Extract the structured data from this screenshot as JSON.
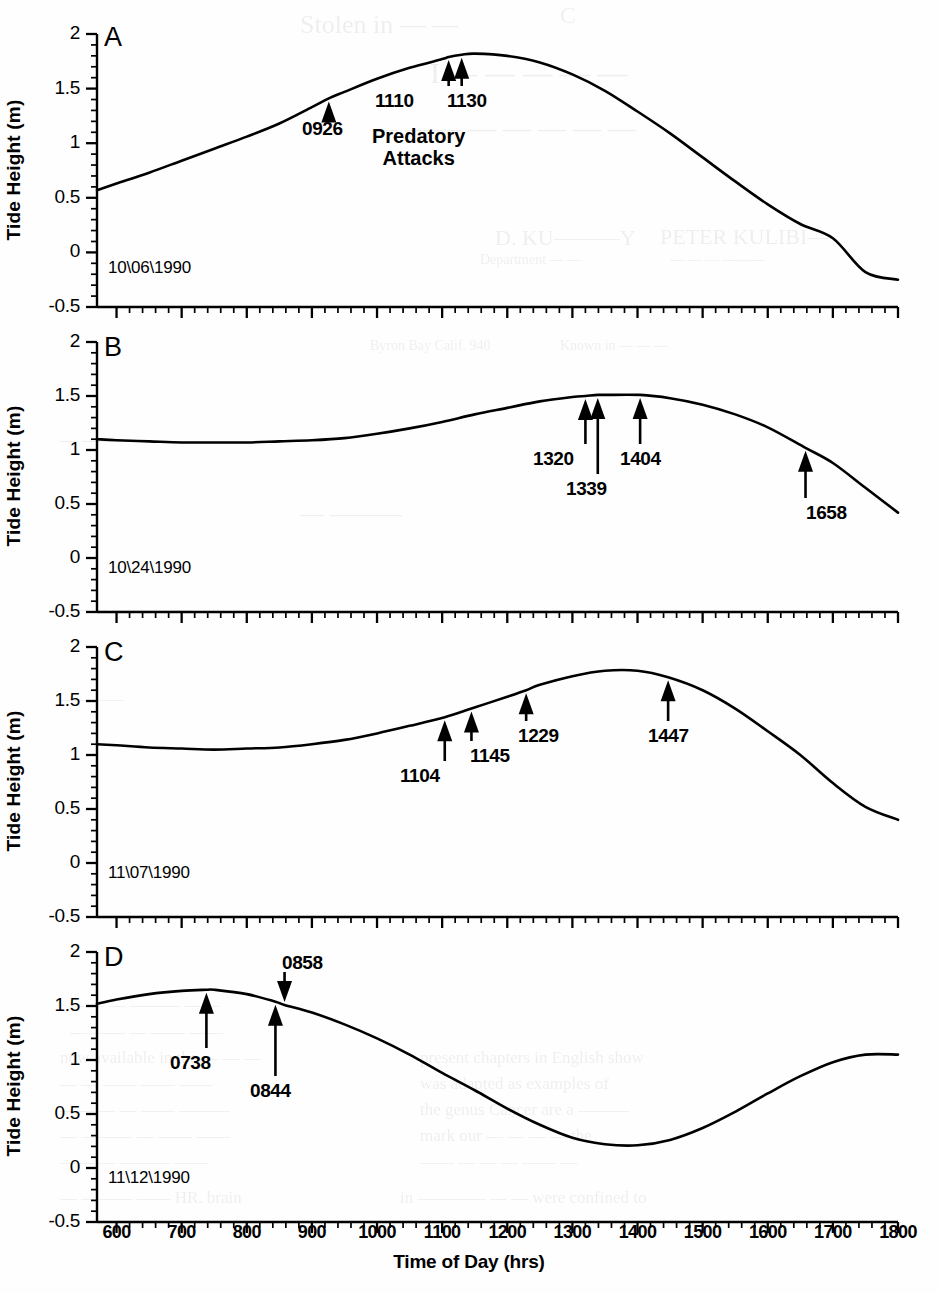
{
  "figure": {
    "y_axis_label": "Tide Height (m)",
    "x_axis_label": "Time of Day (hrs)",
    "attacks_label_line1": "Predatory",
    "attacks_label_line2": "Attacks",
    "y_ticks": [
      "2",
      "1.5",
      "1",
      "0.5",
      "0",
      "-0.5"
    ],
    "x_ticks": [
      "600",
      "700",
      "800",
      "900",
      "1000",
      "1100",
      "1200",
      "1300",
      "1400",
      "1500",
      "1600",
      "1700",
      "1800"
    ],
    "line_color": "#000000",
    "background_color": "#fefefe"
  },
  "chart_data": [
    {
      "type": "line",
      "panel": "A",
      "title": "10\\06\\1990",
      "xlabel": "Time of Day (hrs)",
      "ylabel": "Tide Height (m)",
      "xlim": [
        570,
        1800
      ],
      "ylim": [
        -0.5,
        2
      ],
      "grid": false,
      "x": [
        570,
        600,
        650,
        700,
        750,
        800,
        850,
        900,
        926,
        950,
        1000,
        1050,
        1100,
        1110,
        1130,
        1150,
        1200,
        1250,
        1300,
        1350,
        1400,
        1450,
        1500,
        1550,
        1600,
        1650,
        1700,
        1750,
        1800
      ],
      "values": [
        0.57,
        0.63,
        0.73,
        0.84,
        0.95,
        1.06,
        1.18,
        1.33,
        1.41,
        1.47,
        1.59,
        1.69,
        1.77,
        1.79,
        1.81,
        1.82,
        1.8,
        1.74,
        1.63,
        1.48,
        1.29,
        1.09,
        0.87,
        0.65,
        0.44,
        0.26,
        0.13,
        -0.18,
        -0.25
      ],
      "annotations": [
        {
          "label": "0926",
          "time": 926,
          "tide": 1.41,
          "direction": "up"
        },
        {
          "label": "1110",
          "time": 1110,
          "tide": 1.79,
          "direction": "up"
        },
        {
          "label": "1130",
          "time": 1130,
          "tide": 1.81,
          "direction": "up"
        }
      ]
    },
    {
      "type": "line",
      "panel": "B",
      "title": "10\\24\\1990",
      "xlabel": "Time of Day (hrs)",
      "ylabel": "Tide Height (m)",
      "xlim": [
        570,
        1800
      ],
      "ylim": [
        -0.5,
        2
      ],
      "grid": false,
      "x": [
        570,
        600,
        650,
        700,
        750,
        800,
        850,
        900,
        950,
        1000,
        1050,
        1100,
        1150,
        1200,
        1250,
        1300,
        1320,
        1339,
        1350,
        1404,
        1450,
        1500,
        1550,
        1600,
        1658,
        1700,
        1750,
        1800
      ],
      "values": [
        1.1,
        1.09,
        1.08,
        1.07,
        1.07,
        1.07,
        1.08,
        1.09,
        1.11,
        1.15,
        1.2,
        1.26,
        1.33,
        1.39,
        1.45,
        1.49,
        1.5,
        1.51,
        1.51,
        1.51,
        1.48,
        1.42,
        1.33,
        1.21,
        1.02,
        0.88,
        0.65,
        0.42
      ],
      "annotations": [
        {
          "label": "1320",
          "time": 1320,
          "tide": 1.5,
          "direction": "up"
        },
        {
          "label": "1339",
          "time": 1339,
          "tide": 1.51,
          "direction": "up"
        },
        {
          "label": "1404",
          "time": 1404,
          "tide": 1.51,
          "direction": "up"
        },
        {
          "label": "1658",
          "time": 1658,
          "tide": 1.02,
          "direction": "up"
        }
      ]
    },
    {
      "type": "line",
      "panel": "C",
      "title": "11\\07\\1990",
      "xlabel": "Time of Day (hrs)",
      "ylabel": "Tide Height (m)",
      "xlim": [
        570,
        1800
      ],
      "ylim": [
        -0.5,
        2
      ],
      "grid": false,
      "x": [
        570,
        600,
        650,
        700,
        750,
        800,
        850,
        900,
        950,
        1000,
        1050,
        1104,
        1145,
        1200,
        1229,
        1250,
        1300,
        1350,
        1400,
        1447,
        1500,
        1550,
        1600,
        1650,
        1700,
        1750,
        1800
      ],
      "values": [
        1.1,
        1.09,
        1.07,
        1.06,
        1.05,
        1.06,
        1.07,
        1.1,
        1.14,
        1.2,
        1.27,
        1.35,
        1.43,
        1.54,
        1.6,
        1.65,
        1.73,
        1.78,
        1.78,
        1.72,
        1.6,
        1.43,
        1.22,
        1.0,
        0.74,
        0.52,
        0.4
      ],
      "annotations": [
        {
          "label": "1104",
          "time": 1104,
          "tide": 1.35,
          "direction": "up"
        },
        {
          "label": "1145",
          "time": 1145,
          "tide": 1.43,
          "direction": "up"
        },
        {
          "label": "1229",
          "time": 1229,
          "tide": 1.6,
          "direction": "up"
        },
        {
          "label": "1447",
          "time": 1447,
          "tide": 1.72,
          "direction": "up"
        }
      ]
    },
    {
      "type": "line",
      "panel": "D",
      "title": "11\\12\\1990",
      "xlabel": "Time of Day (hrs)",
      "ylabel": "Tide Height (m)",
      "xlim": [
        570,
        1800
      ],
      "ylim": [
        -0.5,
        2
      ],
      "grid": false,
      "x": [
        570,
        600,
        650,
        700,
        738,
        750,
        800,
        844,
        858,
        900,
        950,
        1000,
        1050,
        1100,
        1150,
        1200,
        1250,
        1300,
        1350,
        1400,
        1450,
        1500,
        1550,
        1600,
        1650,
        1700,
        1750,
        1800
      ],
      "values": [
        1.52,
        1.56,
        1.61,
        1.64,
        1.65,
        1.65,
        1.61,
        1.54,
        1.51,
        1.44,
        1.33,
        1.2,
        1.05,
        0.88,
        0.72,
        0.55,
        0.4,
        0.28,
        0.22,
        0.21,
        0.26,
        0.37,
        0.52,
        0.69,
        0.85,
        0.98,
        1.05,
        1.05
      ],
      "annotations": [
        {
          "label": "0738",
          "time": 738,
          "tide": 1.65,
          "direction": "up"
        },
        {
          "label": "0844",
          "time": 844,
          "tide": 1.54,
          "direction": "up"
        },
        {
          "label": "0858",
          "time": 858,
          "tide": 1.51,
          "direction": "down"
        }
      ]
    }
  ],
  "bleed_text": [
    {
      "t": "C",
      "x": 560,
      "y": 2,
      "s": 24
    },
    {
      "t": "Stolen in —  —",
      "x": 300,
      "y": 10,
      "s": 26
    },
    {
      "t": "I — — — —  —",
      "x": 430,
      "y": 56,
      "s": 30
    },
    {
      "t": "— —— —  — — — —",
      "x": 370,
      "y": 112,
      "s": 28
    },
    {
      "t": "D. KU———Y",
      "x": 495,
      "y": 225,
      "s": 22
    },
    {
      "t": "PETER KULIBI—",
      "x": 660,
      "y": 224,
      "s": 22
    },
    {
      "t": "Department — —",
      "x": 480,
      "y": 252,
      "s": 14
    },
    {
      "t": "— — — ———",
      "x": 670,
      "y": 252,
      "s": 14
    },
    {
      "t": "Byron Bay  Calif. 940",
      "x": 370,
      "y": 338,
      "s": 14
    },
    {
      "t": "Known in — — —",
      "x": 560,
      "y": 338,
      "s": 14
    },
    {
      "t": "—  ——— — ——",
      "x": 60,
      "y": 430,
      "s": 18
    },
    {
      "t": "— ———",
      "x": 300,
      "y": 500,
      "s": 24
    },
    {
      "t": "——— —————",
      "x": 60,
      "y": 600,
      "s": 16
    },
    {
      "t": "— ——— — — —— —— —",
      "x": 440,
      "y": 600,
      "s": 16
    },
    {
      "t": "————",
      "x": 60,
      "y": 690,
      "s": 16
    },
    {
      "t": "—— — ——— ——",
      "x": 70,
      "y": 995,
      "s": 17
    },
    {
      "t": "— —— — —— ——",
      "x": 70,
      "y": 1022,
      "s": 17
    },
    {
      "t": "now available in the — — —",
      "x": 60,
      "y": 1048,
      "s": 17
    },
    {
      "t": "present chapters in English show",
      "x": 420,
      "y": 1048,
      "s": 17
    },
    {
      "t": "— — —— —— ——",
      "x": 60,
      "y": 1074,
      "s": 17
    },
    {
      "t": "was adapted as examples of",
      "x": 420,
      "y": 1074,
      "s": 17
    },
    {
      "t": "—— — — —— ———",
      "x": 60,
      "y": 1100,
      "s": 17
    },
    {
      "t": "the genus Cancer are a ———",
      "x": 420,
      "y": 1100,
      "s": 17
    },
    {
      "t": "— ——— — —— ——",
      "x": 60,
      "y": 1126,
      "s": 17
    },
    {
      "t": "mark our — — — — the",
      "x": 420,
      "y": 1126,
      "s": 17
    },
    {
      "t": "—— — ——— ——",
      "x": 60,
      "y": 1152,
      "s": 17
    },
    {
      "t": "—— — — — —— —",
      "x": 420,
      "y": 1152,
      "s": 17
    },
    {
      "t": "— ——— —— HR. brain",
      "x": 60,
      "y": 1188,
      "s": 17
    },
    {
      "t": "in ———— — — were confined to",
      "x": 400,
      "y": 1188,
      "s": 17
    }
  ]
}
